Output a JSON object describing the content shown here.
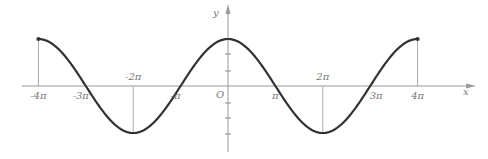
{
  "chart_data": {
    "type": "line",
    "title": "",
    "function": "y = cos(x/2)",
    "xlabel": "x",
    "ylabel": "y",
    "origin_label": "O",
    "xlim": [
      -12.566,
      12.566
    ],
    "ylim": [
      -1,
      1
    ],
    "grid": false,
    "legend": null,
    "x_tick_labels": [
      "-4π",
      "-3π",
      "-2π",
      "-π",
      "π",
      "2π",
      "3π",
      "4π"
    ],
    "x_tick_values_in_pi": [
      -4,
      -3,
      -2,
      -1,
      1,
      2,
      3,
      4
    ],
    "series": [
      {
        "name": "cos(x/2)",
        "x_in_pi": [
          -4,
          -3,
          -2,
          -1,
          0,
          1,
          2,
          3,
          4
        ],
        "values": [
          1,
          0,
          -1,
          0,
          1,
          0,
          -1,
          0,
          1
        ]
      }
    ],
    "annotations": [
      {
        "type": "vertical-drop",
        "x_in_pi": -4,
        "y": 1
      },
      {
        "type": "vertical-drop",
        "x_in_pi": -2,
        "y": -1
      },
      {
        "type": "vertical-drop",
        "x_in_pi": 2,
        "y": -1
      },
      {
        "type": "vertical-drop",
        "x_in_pi": 4,
        "y": 1
      }
    ]
  },
  "layout": {
    "origin_px": [
      228,
      86
    ],
    "pi_px": 47.4,
    "amp_px": 47,
    "x_axis_start": 22,
    "x_axis_end": 472,
    "y_axis_top": 6,
    "y_axis_bottom": 152,
    "y_ticks_px": [
      54,
      71,
      103,
      118,
      134
    ],
    "colors": {
      "curve": "#333333",
      "axis": "#999999",
      "label": "#777777"
    }
  }
}
